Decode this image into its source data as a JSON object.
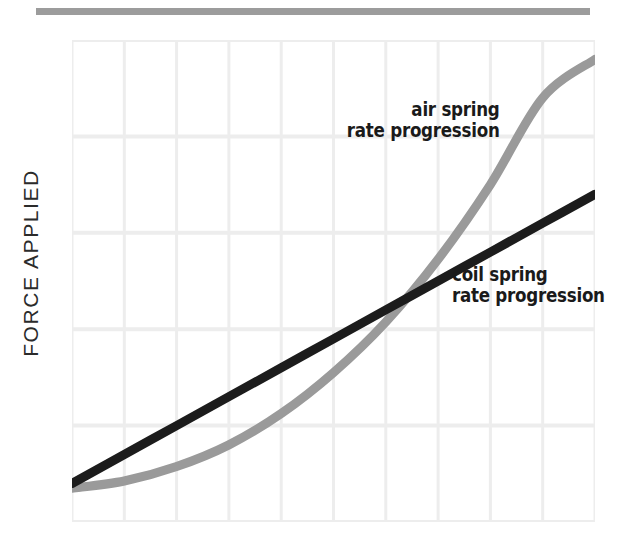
{
  "figure": {
    "width": 617,
    "height": 547,
    "background": "#ffffff",
    "top_rule_color": "#9c9c9c"
  },
  "axes": {
    "y_label": "FORCE APPLIED",
    "x_label": "",
    "grid_color": "#ededed",
    "grid_visible": true,
    "grid_columns": 10,
    "grid_rows": 5
  },
  "labels": {
    "air_spring": {
      "line1": "air spring",
      "line2": "rate progression"
    },
    "coil_spring": {
      "line1": "coil spring",
      "line2": "rate progression"
    }
  },
  "colors": {
    "air_spring": "#9a9a9a",
    "coil_spring": "#1c1c1c",
    "grid": "#ededed",
    "rule": "#9c9c9c",
    "text": "#2b2b2b"
  },
  "chart_data": {
    "type": "line",
    "title": "",
    "subtitle": "",
    "xlabel": "",
    "ylabel": "FORCE APPLIED",
    "xlim": [
      0,
      10
    ],
    "ylim": [
      0,
      10
    ],
    "grid": true,
    "legend_position": "inline-annotation",
    "x_tick_labels": [],
    "y_tick_labels": [],
    "x": [
      0,
      1,
      2,
      3,
      4,
      5,
      6,
      7,
      8,
      9,
      10
    ],
    "series": [
      {
        "name": "coil spring rate progression",
        "color": "#1c1c1c",
        "linewidth": 9,
        "shape": "linear",
        "values": [
          0.8,
          1.4,
          2.0,
          2.6,
          3.2,
          3.8,
          4.4,
          5.0,
          5.6,
          6.2,
          6.8
        ],
        "annotation": "coil spring\nrate progression"
      },
      {
        "name": "air spring rate progression",
        "color": "#9a9a9a",
        "linewidth": 9,
        "shape": "exponential",
        "values": [
          0.7,
          0.85,
          1.15,
          1.6,
          2.25,
          3.1,
          4.15,
          5.45,
          7.0,
          8.8,
          9.6
        ],
        "annotation": "air spring\nrate progression"
      }
    ],
    "annotations": [
      {
        "text": "air spring rate progression",
        "target_series": "air spring rate progression",
        "align": "right"
      },
      {
        "text": "coil spring rate progression",
        "target_series": "coil spring rate progression",
        "align": "left"
      }
    ],
    "crossover_point": {
      "x": 6.3,
      "y": 4.5
    }
  }
}
